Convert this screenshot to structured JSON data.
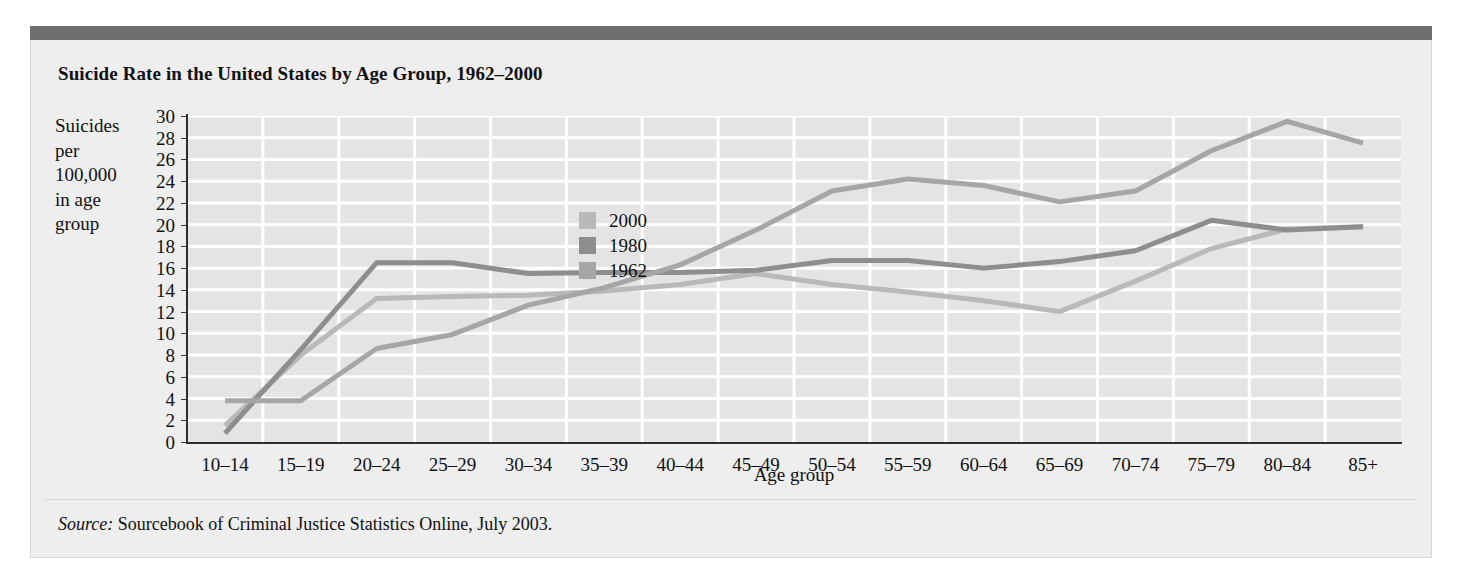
{
  "figure": {
    "title": "Suicide Rate in the United States by Age Group, 1962–2000",
    "source_prefix": "Source:",
    "source_text": " Sourcebook of Criminal Justice Statistics Online, July 2003."
  },
  "colors": {
    "top_bar": "#6e6e6e",
    "figure_bg": "#eeeeee",
    "plot_bg": "#e4e4e4",
    "gridline": "#ffffff",
    "axis": "#2e2e2e",
    "series_2000": "#b9b9b9",
    "series_1980": "#8e8e8e",
    "series_1962": "#a6a6a6"
  },
  "chart_data": {
    "type": "line",
    "title": "Suicide Rate in the United States by Age Group, 1962–2000",
    "xlabel": "Age group",
    "ylabel": "Suicides per 100,000 in age group",
    "ylabel_lines": [
      "Suicides",
      "per",
      "100,000",
      "in age",
      "group"
    ],
    "ylim": [
      0,
      30
    ],
    "ytick_step": 2,
    "yticks": [
      0,
      2,
      4,
      6,
      8,
      10,
      12,
      14,
      16,
      18,
      20,
      22,
      24,
      26,
      28,
      30
    ],
    "grid": true,
    "legend_position": "inside-upper-center-left",
    "categories": [
      "10–14",
      "15–19",
      "20–24",
      "25–29",
      "30–34",
      "35–39",
      "40–44",
      "45–49",
      "50–54",
      "55–59",
      "60–64",
      "65–69",
      "70–74",
      "75–79",
      "80–84",
      "85+"
    ],
    "series": [
      {
        "name": "2000",
        "color": "#b9b9b9",
        "values": [
          1.5,
          8.0,
          13.2,
          13.4,
          13.5,
          13.9,
          14.5,
          15.5,
          14.5,
          13.8,
          13.0,
          12.0,
          14.8,
          17.8,
          19.6,
          19.8
        ]
      },
      {
        "name": "1980",
        "color": "#8e8e8e",
        "values": [
          0.8,
          8.5,
          16.5,
          16.5,
          15.5,
          15.6,
          15.6,
          15.8,
          16.7,
          16.7,
          16.0,
          16.6,
          17.6,
          20.4,
          19.5,
          19.8
        ]
      },
      {
        "name": "1962",
        "color": "#a6a6a6",
        "values": [
          3.8,
          3.8,
          8.6,
          9.9,
          12.6,
          14.2,
          16.3,
          19.5,
          23.1,
          24.2,
          23.6,
          22.1,
          23.1,
          26.8,
          29.5,
          27.5
        ]
      }
    ]
  }
}
